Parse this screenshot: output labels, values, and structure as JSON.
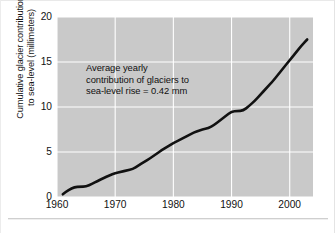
{
  "chart_data": {
    "type": "line",
    "title": "",
    "xlabel": "",
    "ylabel": "Cumulative glacier contribution to sea-level (millimeters)",
    "ylabel_lines": [
      "Cumulative glacier contribution",
      "to sea-level (millimeters)"
    ],
    "annotation": "Average yearly contribution of glaciers to sea-level rise = 0.42 mm",
    "annotation_lines": [
      "Average yearly",
      "contribution of glaciers to",
      "sea-level rise = 0.42 mm"
    ],
    "xlim": [
      1960,
      2004
    ],
    "ylim": [
      0,
      20
    ],
    "xticks": [
      1960,
      1970,
      1980,
      1990,
      2000
    ],
    "xtick_labels": [
      "1960",
      "1970",
      "1980",
      "1990",
      "2000"
    ],
    "yticks": [
      0,
      5,
      10,
      15,
      20
    ],
    "ytick_labels": [
      "0",
      "5",
      "10",
      "15",
      "20"
    ],
    "grid": true,
    "grid_color": "#ffffff",
    "plot_background": "#c9c9c9",
    "line_color": "#111111",
    "line_width": 2.6,
    "legend": "none",
    "series": [
      {
        "name": "Cumulative glacier contribution to sea level",
        "x": [
          1961,
          1962,
          1963,
          1964,
          1965,
          1966,
          1967,
          1968,
          1969,
          1970,
          1971,
          1972,
          1973,
          1974,
          1975,
          1976,
          1977,
          1978,
          1979,
          1980,
          1981,
          1982,
          1983,
          1984,
          1985,
          1986,
          1987,
          1988,
          1989,
          1990,
          1991,
          1992,
          1993,
          1994,
          1995,
          1996,
          1997,
          1998,
          1999,
          2000,
          2001,
          2002,
          2003
        ],
        "values": [
          0.3,
          0.8,
          1.1,
          1.15,
          1.15,
          1.45,
          1.8,
          2.1,
          2.4,
          2.65,
          2.8,
          2.95,
          3.1,
          3.5,
          3.9,
          4.3,
          4.75,
          5.2,
          5.6,
          6.0,
          6.3,
          6.65,
          7.0,
          7.3,
          7.5,
          7.65,
          8.0,
          8.5,
          9.0,
          9.5,
          9.55,
          9.6,
          10.1,
          10.7,
          11.4,
          12.1,
          12.8,
          13.6,
          14.4,
          15.2,
          16.0,
          16.8,
          17.5
        ]
      }
    ]
  }
}
